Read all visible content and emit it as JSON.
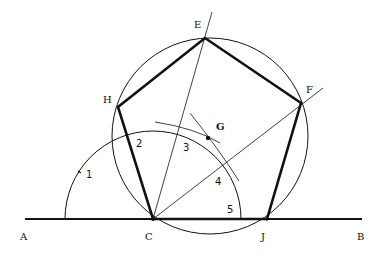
{
  "diagram": {
    "colors": {
      "ink": "#111111",
      "background": "#ffffff"
    },
    "point_labels": {
      "A": "A",
      "B": "B",
      "C": "C",
      "J": "J",
      "E": "E",
      "F": "F",
      "G": "G",
      "H": "H"
    },
    "arc_division_labels": [
      "1",
      "2",
      "3",
      "4",
      "5"
    ],
    "elements": [
      "baseline AB",
      "semicircle centered at C divided into 5 parts",
      "regular pentagon C-J-F-E-H (bold)",
      "circumscribed circle through C, J, F, E, H",
      "construction lines from C through divisions 3 and 4",
      "perpendicular bisector arcs locating center G"
    ]
  }
}
